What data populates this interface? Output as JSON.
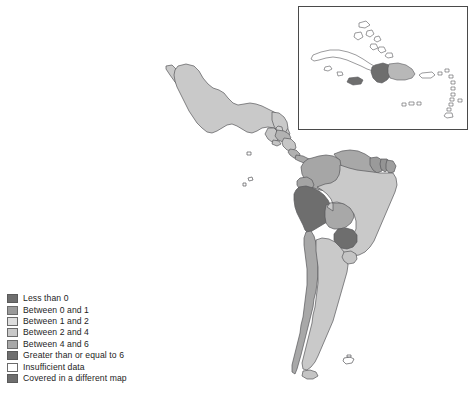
{
  "figure": {
    "type": "choropleth-map",
    "region": "Latin America and the Caribbean",
    "background_color": "#ffffff",
    "border_color": "#4a4a4a"
  },
  "inset": {
    "name": "caribbean-inset",
    "region": "Caribbean",
    "border_color": "#4a4a4a",
    "background_color": "#ffffff"
  },
  "legend": {
    "name": "map-legend",
    "items": [
      {
        "label": "Less than 0",
        "color": "#6e6e6e",
        "border": "#5a5a5a"
      },
      {
        "label": "Between 0 and 1",
        "color": "#9a9a9a",
        "border": "#6b6b6b"
      },
      {
        "label": "Between 1 and 2",
        "color": "#dedede",
        "border": "#6b6b6b"
      },
      {
        "label": "Between 2 and 4",
        "color": "#c9c9c9",
        "border": "#6b6b6b"
      },
      {
        "label": "Between 4 and 6",
        "color": "#a8a8a8",
        "border": "#6b6b6b"
      },
      {
        "label": "Greater than or equal to 6",
        "color": "#6e6e6e",
        "border": "#5a5a5a"
      },
      {
        "label": "Insufficient data",
        "color": "#ffffff",
        "border": "#6b6b6b"
      },
      {
        "label": "Covered in a different map",
        "color": "#6e6e6e",
        "border": "#5a5a5a"
      }
    ]
  },
  "map_data": {
    "type": "choropleth",
    "color_scale": [
      "#6e6e6e",
      "#9a9a9a",
      "#dedede",
      "#c9c9c9",
      "#a8a8a8",
      "#6e6e6e",
      "#ffffff"
    ],
    "outline_color": "#58585a",
    "regions": [
      {
        "name": "Mexico",
        "class": "between-2-and-4",
        "color": "#c9c9c9"
      },
      {
        "name": "Guatemala",
        "class": "between-2-and-4",
        "color": "#c6c6c6"
      },
      {
        "name": "Belize",
        "class": "between-2-and-4",
        "color": "#cfcfcf"
      },
      {
        "name": "Honduras",
        "class": "between-4-and-6",
        "color": "#b2b2b2"
      },
      {
        "name": "El Salvador",
        "class": "between-2-and-4",
        "color": "#c4c4c4"
      },
      {
        "name": "Nicaragua",
        "class": "between-2-and-4",
        "color": "#c6c6c6"
      },
      {
        "name": "Costa Rica",
        "class": "between-4-and-6",
        "color": "#b0b0b0"
      },
      {
        "name": "Panama",
        "class": "between-4-and-6",
        "color": "#a8a8a8"
      },
      {
        "name": "Colombia",
        "class": "between-4-and-6",
        "color": "#a6a6a6"
      },
      {
        "name": "Venezuela",
        "class": "between-4-and-6",
        "color": "#a8a8a8"
      },
      {
        "name": "Guyana",
        "class": "between-0-and-1",
        "color": "#9a9a9a"
      },
      {
        "name": "Suriname",
        "class": "between-0-and-1",
        "color": "#949494"
      },
      {
        "name": "French Guiana",
        "class": "between-0-and-1",
        "color": "#9e9e9e"
      },
      {
        "name": "Ecuador",
        "class": "between-4-and-6",
        "color": "#a4a4a4"
      },
      {
        "name": "Peru",
        "class": "greater-or-equal-6",
        "color": "#6e6e6e"
      },
      {
        "name": "Bolivia",
        "class": "between-4-and-6",
        "color": "#a8a8a8"
      },
      {
        "name": "Brazil",
        "class": "between-2-and-4",
        "color": "#c9c9c9"
      },
      {
        "name": "Paraguay",
        "class": "greater-or-equal-6",
        "color": "#6e6e6e"
      },
      {
        "name": "Chile",
        "class": "between-4-and-6",
        "color": "#a8a8a8"
      },
      {
        "name": "Argentina",
        "class": "between-2-and-4",
        "color": "#c9c9c9"
      },
      {
        "name": "Uruguay",
        "class": "between-2-and-4",
        "color": "#c4c4c4"
      },
      {
        "name": "Falkland Islands",
        "class": "insufficient-data",
        "color": "#ffffff"
      }
    ],
    "inset_regions": [
      {
        "name": "Cuba",
        "class": "insufficient-data",
        "color": "#ffffff"
      },
      {
        "name": "Bahamas",
        "class": "insufficient-data",
        "color": "#ffffff"
      },
      {
        "name": "Jamaica",
        "class": "greater-or-equal-6",
        "color": "#6e6e6e"
      },
      {
        "name": "Haiti",
        "class": "greater-or-equal-6",
        "color": "#6e6e6e"
      },
      {
        "name": "Dominican Republic",
        "class": "between-2-and-4",
        "color": "#b8b8b8"
      },
      {
        "name": "Puerto Rico",
        "class": "insufficient-data",
        "color": "#ffffff"
      },
      {
        "name": "Lesser Antilles",
        "class": "insufficient-data",
        "color": "#ffffff"
      },
      {
        "name": "Trinidad and Tobago",
        "class": "insufficient-data",
        "color": "#ffffff"
      }
    ]
  }
}
